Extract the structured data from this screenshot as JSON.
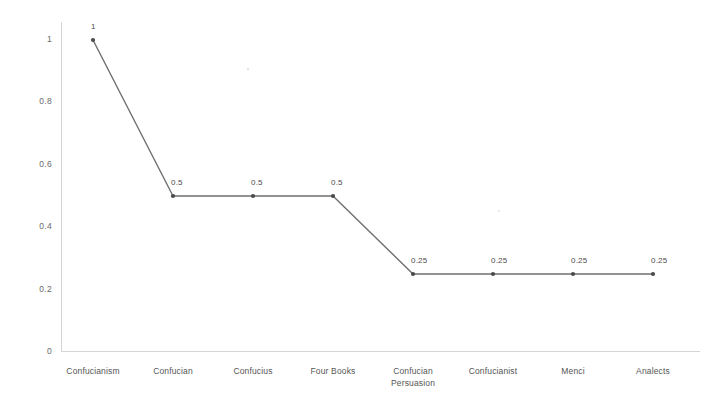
{
  "chart_data": {
    "type": "line",
    "title": "",
    "subtitle": "",
    "xlabel": "",
    "ylabel": "",
    "categories": [
      "Confucianism",
      "Confucian",
      "Confucius",
      "Four Books",
      "Confucian\nPersuasion",
      "Confucianist",
      "Menci",
      "Analects"
    ],
    "values": [
      1,
      0.5,
      0.5,
      0.5,
      0.25,
      0.25,
      0.25,
      0.25
    ],
    "point_labels": [
      "1",
      "0.5",
      "0.5",
      "0.5",
      "0.25",
      "0.25",
      "0.25",
      "0.25"
    ],
    "ylim": [
      0,
      1
    ],
    "ytick_labels": [
      "1",
      "0.8",
      "0.6",
      "0.4",
      "0.2",
      "0"
    ],
    "ytick_values": [
      1,
      0.8,
      0.6,
      0.4,
      0.2,
      0
    ],
    "grid": false,
    "legend": null,
    "legend_position": "none",
    "series": [
      {
        "name": "frequency",
        "values": [
          1,
          0.5,
          0.5,
          0.5,
          0.25,
          0.25,
          0.25,
          0.25
        ]
      }
    ],
    "line_color": "#6f6f6f",
    "marker_color": "#4a4a4a",
    "axis_color": "#d5d5d5",
    "background_color": "#ffffff"
  }
}
